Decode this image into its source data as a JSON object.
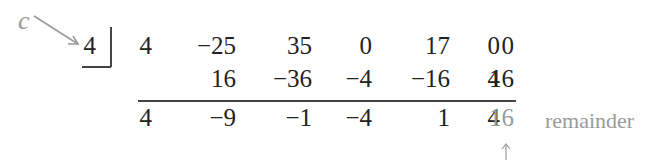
{
  "divisor": {
    "label": "c",
    "value": "4"
  },
  "row1": [
    "4",
    "−25",
    "35",
    "0",
    "17",
    "0",
    "0"
  ],
  "row2": [
    "16",
    "−36",
    "−4",
    "−16",
    "4",
    "16"
  ],
  "row3": [
    "4",
    "−9",
    "−1",
    "−4",
    "1",
    "4",
    "16"
  ],
  "remainder_label": "remainder",
  "colors": {
    "text": "#222222",
    "annotation": "#9a9a9a"
  }
}
